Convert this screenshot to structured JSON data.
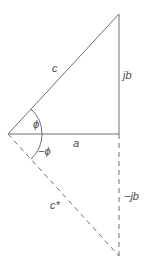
{
  "diagram": {
    "colors": {
      "line": "#6e6e6e",
      "text": "#4a4a4a"
    },
    "labels": {
      "hypotenuse": "c",
      "vertical": "jb",
      "horizontal": "a",
      "angle_top": "ϕ",
      "angle_bottom": "−ϕ",
      "conjugate_hypotenuse": "c*",
      "conjugate_vertical": "−jb"
    }
  }
}
